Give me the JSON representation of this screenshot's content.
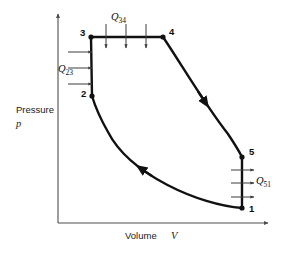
{
  "figure": {
    "type": "pv-diagram"
  },
  "axes": {
    "y": {
      "label_line1": "Pressure",
      "label_line2": "p",
      "arrow": "up"
    },
    "x": {
      "label_text": "Volume",
      "label_symbol": "V",
      "arrow": "right"
    }
  },
  "chart_data": {
    "type": "line",
    "title": "",
    "xlabel": "Volume V",
    "ylabel": "Pressure p",
    "grid": false,
    "legend": null,
    "axis_arrows": true,
    "states": [
      {
        "name": "1",
        "x": 242,
        "y": 208,
        "label_dx": 7,
        "label_dy": 4
      },
      {
        "name": "2",
        "x": 92,
        "y": 96,
        "label_dx": -11,
        "label_dy": 1
      },
      {
        "name": "3",
        "x": 91,
        "y": 37,
        "label_dx": -11,
        "label_dy": -1
      },
      {
        "name": "4",
        "x": 163,
        "y": 37,
        "label_dx": 6,
        "label_dy": -2
      },
      {
        "name": "5",
        "x": 242,
        "y": 157,
        "label_dx": 7,
        "label_dy": -2
      }
    ],
    "processes": [
      {
        "from": "1",
        "to": "2",
        "kind": "curve",
        "description": "compression",
        "path": "M 242 208 C 200 205 130 175 108 132 C 100 118 95 106 92 96",
        "arrow_at": 0.52,
        "arrow_dir": "toward-2"
      },
      {
        "from": "2",
        "to": "3",
        "kind": "isochoric",
        "description": "constant volume heat addition",
        "path": "M 92 96 L 91 37"
      },
      {
        "from": "3",
        "to": "4",
        "kind": "isobaric",
        "description": "constant pressure heat addition",
        "path": "M 91 37 L 163 37"
      },
      {
        "from": "4",
        "to": "5",
        "kind": "curve",
        "description": "expansion",
        "path": "M 163 37 C 180 62 205 105 228 134 C 234 143 239 151 242 157",
        "arrow_at": 0.5,
        "arrow_dir": "toward-5"
      },
      {
        "from": "5",
        "to": "1",
        "kind": "isochoric",
        "description": "constant volume heat rejection",
        "path": "M 242 157 L 242 208"
      }
    ],
    "heat_interactions": [
      {
        "id": "Q23",
        "symbol": "Q",
        "subscript": "23",
        "label_x": 58,
        "label_y": 72,
        "arrow_direction": "right",
        "target_process": "2-3",
        "arrow_count": 3,
        "arrows": [
          {
            "x1": 68,
            "y1": 52,
            "x2": 92,
            "y2": 52
          },
          {
            "x1": 68,
            "y1": 68,
            "x2": 92,
            "y2": 68
          },
          {
            "x1": 68,
            "y1": 84,
            "x2": 92,
            "y2": 84
          }
        ]
      },
      {
        "id": "Q34",
        "symbol": "Q",
        "subscript": "34",
        "label_x": 111,
        "label_y": 20,
        "arrow_direction": "down",
        "target_process": "3-4",
        "arrow_count": 3,
        "arrows": [
          {
            "x1": 106,
            "y1": 24,
            "x2": 106,
            "y2": 48
          },
          {
            "x1": 126,
            "y1": 24,
            "x2": 126,
            "y2": 48
          },
          {
            "x1": 146,
            "y1": 24,
            "x2": 146,
            "y2": 48
          }
        ]
      },
      {
        "id": "Q51",
        "symbol": "Q",
        "subscript": "51",
        "label_x": 256,
        "label_y": 184,
        "arrow_direction": "right",
        "target_process": "5-1",
        "arrow_count": 3,
        "arrows": [
          {
            "x1": 231,
            "y1": 170,
            "x2": 254,
            "y2": 170
          },
          {
            "x1": 231,
            "y1": 183,
            "x2": 254,
            "y2": 183
          },
          {
            "x1": 231,
            "y1": 197,
            "x2": 254,
            "y2": 197
          }
        ]
      }
    ],
    "xlim": [
      58,
      272
    ],
    "ylim": [
      223,
      10
    ]
  },
  "colors": {
    "process": "#111111",
    "axis": "#4d4d4d",
    "flux": "#3d3d3d",
    "text": "#0d0d0d",
    "background": "#ffffff"
  }
}
